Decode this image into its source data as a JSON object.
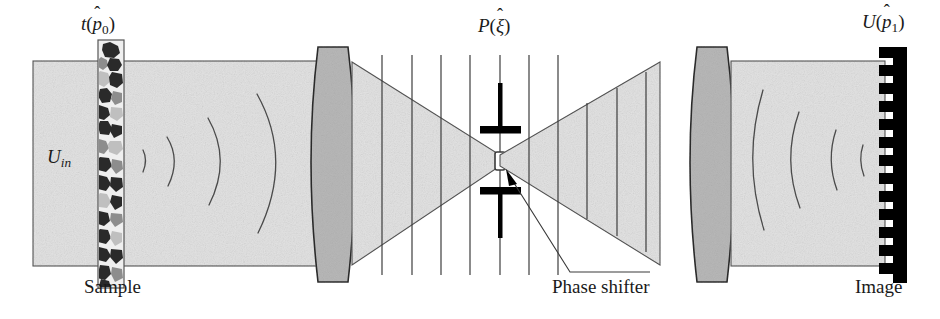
{
  "figure": {
    "kind": "optical-diagram",
    "width": 940,
    "height": 319
  },
  "labels": {
    "transmittance": {
      "fn": "t",
      "arg_base": "p",
      "arg_hat": "̂",
      "arg_sub": "0",
      "text": "t(p̂0)"
    },
    "input_field": {
      "base": "U",
      "sub": "in",
      "text": "Uin"
    },
    "pupil": {
      "fn": "P",
      "arg_base": "ξ",
      "arg_hat": "̂",
      "text": "P(ξ̂)"
    },
    "output_field": {
      "fn": "U",
      "arg_base": "p",
      "arg_hat": "̂",
      "arg_sub": "1",
      "text": "U(p̂1)"
    },
    "sample_caption": "Sample",
    "image_caption": "Image",
    "phase_shifter_caption": "Phase shifter"
  },
  "colors": {
    "ink": "#1a1a1a",
    "beam_fill": "#e3e3e3",
    "beam_stroke": "#555555",
    "lens_fill": "#b8b8b8",
    "lens_stroke": "#2b2b2b",
    "wavefront": "#4a4a4a",
    "detector": "#000000",
    "sample_frame": "#555555",
    "sample_fill": "#efefef",
    "grain_dark": "#2a2a2a",
    "grain_mid": "#8d8d8d",
    "grain_light": "#bfbfbf",
    "aperture": "#000000",
    "phase_element_fill": "#ffffff"
  },
  "geometry": {
    "beam_left": {
      "x0": 33,
      "x1": 310,
      "top": 61,
      "bottom": 266
    },
    "beam_right": {
      "x0": 660,
      "x1": 885,
      "top": 61,
      "bottom": 266
    },
    "focus": {
      "x": 500,
      "y": 160
    },
    "lens_left": {
      "cx": 333,
      "top": 46,
      "bottom": 283,
      "half_width": 28
    },
    "lens_right": {
      "cx": 712,
      "top": 46,
      "bottom": 283,
      "half_width": 28
    },
    "sample": {
      "x": 98,
      "width": 26,
      "top": 40,
      "bottom": 288
    },
    "detector": {
      "x": 885,
      "width": 22,
      "top": 47,
      "bottom": 283,
      "teeth": 13
    }
  },
  "elements": {
    "wavefronts_left_count": 4,
    "wavefronts_right_count": 4,
    "pupil_lines_left_count": 5,
    "pupil_lines_right_count": 5,
    "aperture_bars": 2,
    "phase_element_shape": "rectangle"
  }
}
